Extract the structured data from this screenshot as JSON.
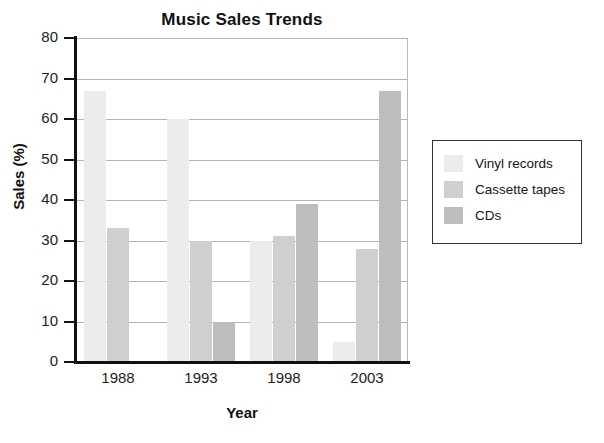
{
  "chart_data": {
    "type": "bar",
    "title": "Music Sales Trends",
    "xlabel": "Year",
    "ylabel": "Sales (%)",
    "categories": [
      "1988",
      "1993",
      "1998",
      "2003"
    ],
    "series": [
      {
        "name": "Vinyl records",
        "values": [
          67,
          60,
          30,
          5
        ],
        "color": "#ececec"
      },
      {
        "name": "Cassette tapes",
        "values": [
          33,
          30,
          31,
          28
        ],
        "color": "#cfcfcf"
      },
      {
        "name": "CDs",
        "values": [
          0,
          10,
          39,
          67
        ],
        "color": "#bdbdbd"
      }
    ],
    "ylim": [
      0,
      80
    ],
    "yticks": [
      "0",
      "10",
      "20",
      "30",
      "40",
      "50",
      "60",
      "70",
      "80"
    ],
    "grid": true,
    "legend_position": "right"
  },
  "legend": {
    "items": [
      {
        "label": "Vinyl records"
      },
      {
        "label": "Cassette tapes"
      },
      {
        "label": "CDs"
      }
    ]
  }
}
